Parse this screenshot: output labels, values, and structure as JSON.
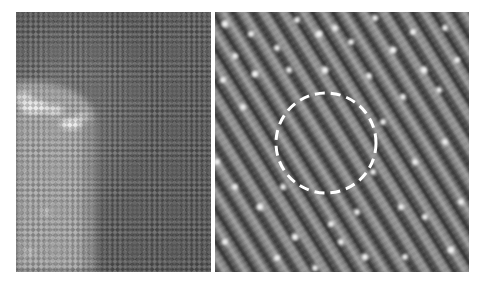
{
  "figure": {
    "panels": [
      {
        "id": "left",
        "description": "STM topograph: dark atomic lattice (checkerboard) with bright island/step region at lower-left",
        "base_color": "#575757",
        "highlight_color": "#a8a8a8"
      },
      {
        "id": "right",
        "description": "STM topograph: diagonal atomic rows with bright point defects; dashed circle highlighting region",
        "base_color": "#6a6a6a",
        "annotation": {
          "type": "dashed-circle",
          "color": "#ffffff"
        }
      }
    ]
  }
}
